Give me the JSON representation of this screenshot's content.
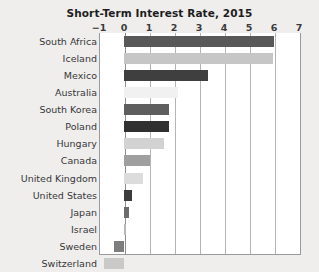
{
  "chart_data": {
    "type": "bar",
    "orientation": "horizontal",
    "title": "Short-Term Interest Rate, 2015",
    "xlabel": "",
    "ylabel": "",
    "xlim": [
      -1,
      7
    ],
    "xticks": [
      "−1",
      "0",
      "1",
      "2",
      "3",
      "4",
      "5",
      "6",
      "7"
    ],
    "xtick_values": [
      -1,
      0,
      1,
      2,
      3,
      4,
      5,
      6,
      7
    ],
    "grid": "vertical",
    "legend": "none",
    "categories": [
      "South Africa",
      "Iceland",
      "Mexico",
      "Australia",
      "South Korea",
      "Poland",
      "Hungary",
      "Canada",
      "United Kingdom",
      "United States",
      "Japan",
      "Israel",
      "Sweden",
      "Switzerland"
    ],
    "values": [
      6.0,
      5.95,
      3.35,
      2.15,
      1.8,
      1.78,
      1.6,
      1.05,
      0.75,
      0.3,
      0.2,
      0.08,
      -0.4,
      -0.8
    ],
    "bars": [
      {
        "label": "South Africa",
        "value": 6.0,
        "color": "#585858"
      },
      {
        "label": "Iceland",
        "value": 5.95,
        "color": "#c6c6c6"
      },
      {
        "label": "Mexico",
        "value": 3.35,
        "color": "#3f3f3f"
      },
      {
        "label": "Australia",
        "value": 2.15,
        "color": "#f1f1f1"
      },
      {
        "label": "South Korea",
        "value": 1.8,
        "color": "#5e5e5e"
      },
      {
        "label": "Poland",
        "value": 1.78,
        "color": "#303030"
      },
      {
        "label": "Hungary",
        "value": 1.6,
        "color": "#d2d2d2"
      },
      {
        "label": "Canada",
        "value": 1.05,
        "color": "#9f9f9f"
      },
      {
        "label": "United Kingdom",
        "value": 0.75,
        "color": "#dcdcdc"
      },
      {
        "label": "United States",
        "value": 0.3,
        "color": "#3c3c3c"
      },
      {
        "label": "Japan",
        "value": 0.2,
        "color": "#6b6b6b"
      },
      {
        "label": "Israel",
        "value": 0.08,
        "color": "#b8b8b8"
      },
      {
        "label": "Sweden",
        "value": -0.4,
        "color": "#7d7d7d"
      },
      {
        "label": "Switzerland",
        "value": -0.8,
        "color": "#c9c9c9"
      }
    ]
  },
  "colors": {
    "page_background": "#efeeec",
    "plot_background": "#ffffff",
    "gridline": "#b4b4b4",
    "axis": "#9a9a9a",
    "title_text": "#1d1d1d",
    "label_text": "#37373a"
  }
}
